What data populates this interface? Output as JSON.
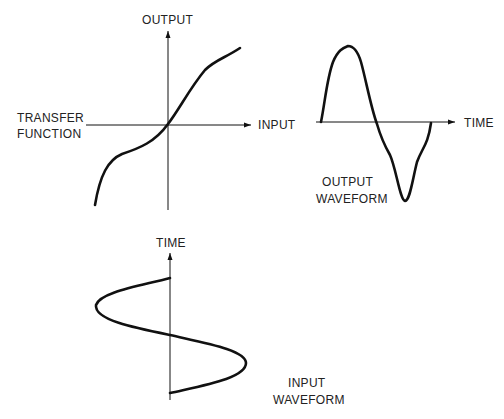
{
  "transfer_function": {
    "title_line1": "TRANSFER",
    "title_line2": "FUNCTION",
    "y_axis_label": "OUTPUT",
    "x_axis_label": "INPUT"
  },
  "output_waveform": {
    "axis_label": "TIME",
    "title_line1": "OUTPUT",
    "title_line2": "WAVEFORM"
  },
  "input_waveform": {
    "axis_label": "TIME",
    "title_line1": "INPUT",
    "title_line2": "WAVEFORM"
  },
  "colors": {
    "stroke": "#111111",
    "background": "#ffffff"
  }
}
